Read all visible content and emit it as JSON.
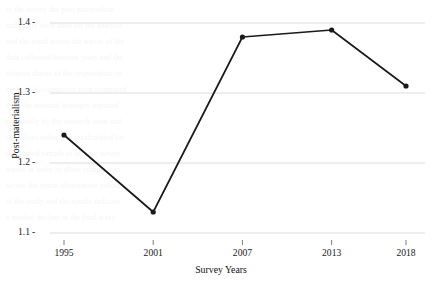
{
  "chart_data": {
    "type": "line",
    "title": "",
    "subtitle": "",
    "xlabel": "Survey Years",
    "ylabel": "Post-materialism",
    "categories": [
      "1995",
      "2001",
      "2007",
      "2013",
      "2018"
    ],
    "x": [
      1995,
      2001,
      2007,
      2013,
      2018
    ],
    "values": [
      1.24,
      1.13,
      1.38,
      1.39,
      1.31
    ],
    "series": [
      {
        "name": "Post-materialism",
        "values": [
          1.24,
          1.13,
          1.38,
          1.39,
          1.31
        ]
      }
    ],
    "ylim": [
      1.1,
      1.4
    ],
    "xlim": [
      1995,
      2018
    ],
    "yticks": [
      "1.4",
      "1.3",
      "1.2",
      "1.1"
    ],
    "ytick_values": [
      1.4,
      1.3,
      1.2,
      1.1
    ],
    "xticks": [
      "1995",
      "2001",
      "2007",
      "2013",
      "2018"
    ],
    "grid": "horizontal",
    "legend": "none",
    "line_color": "#1a1a1a",
    "marker": "circle",
    "marker_color": "#1a1a1a",
    "grid_color": "#d8d8dc",
    "background_color": "#ffffff"
  },
  "axes": {
    "y_title": "Post-materialism",
    "x_title": "Survey Years"
  },
  "y_ticks": [
    {
      "label": "1.4",
      "value": 1.4
    },
    {
      "label": "1.3",
      "value": 1.3
    },
    {
      "label": "1.2",
      "value": 1.2
    },
    {
      "label": "1.1",
      "value": 1.1
    }
  ],
  "x_ticks": [
    {
      "label": "1995",
      "value": 1995
    },
    {
      "label": "2001",
      "value": 2001
    },
    {
      "label": "2007",
      "value": 2007
    },
    {
      "label": "2013",
      "value": 2013
    },
    {
      "label": "2018",
      "value": 2018
    }
  ],
  "background_text": {
    "lines": [
      "in the survey the post materialism",
      "indicators were used for the analysis",
      "and the trend across the waves of the",
      "data collected between years and the",
      "relative shares of the respondents in",
      "each of the categories were compared",
      "with the national averages reported",
      "previously by the research team and",
      "the values index was recalculated for",
      "the pooled sample of all five survey",
      "waves in order to allow comparison",
      "across the entire observation period",
      "of the study and the results indicate",
      "a modest decline in the final wave"
    ]
  }
}
